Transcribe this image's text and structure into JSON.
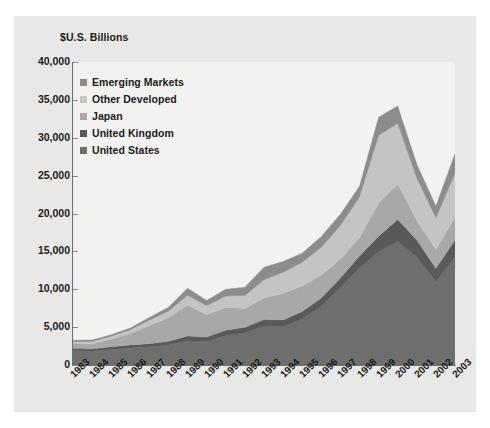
{
  "figure": {
    "axis_title": "$U.S. Billions",
    "panel_color": "#e8e8e6",
    "plot_color": "#f2f2f0"
  },
  "legend": {
    "position": "inside-top-left",
    "entries": [
      {
        "label": "Emerging Markets",
        "color": "#8c8c8c"
      },
      {
        "label": "Other Developed",
        "color": "#c4c4c4"
      },
      {
        "label": "Japan",
        "color": "#a8a8a8"
      },
      {
        "label": "United Kingdom",
        "color": "#595959"
      },
      {
        "label": "United States",
        "color": "#6e6e6e"
      }
    ]
  },
  "axes": {
    "y_ticks": [
      "0",
      "5,000",
      "10,000",
      "15,000",
      "20,000",
      "25,000",
      "30,000",
      "35,000",
      "40,000"
    ],
    "y_tick_values": [
      0,
      5000,
      10000,
      15000,
      20000,
      25000,
      30000,
      35000,
      40000
    ],
    "ylim": [
      0,
      40000
    ],
    "x_ticks": [
      "1983",
      "1984",
      "1985",
      "1986",
      "1987",
      "1988",
      "1989",
      "1990",
      "1991",
      "1992",
      "1993",
      "1994",
      "1995",
      "1996",
      "1997",
      "1998",
      "1999",
      "2000",
      "2001",
      "2002",
      "2003"
    ]
  },
  "chart_data": {
    "type": "area",
    "title": "",
    "subtitle": "",
    "xlabel": "",
    "ylabel": "$U.S. Billions",
    "ylim": [
      0,
      40000
    ],
    "grid": false,
    "legend_position": "inside-top-left",
    "stacked": true,
    "categories": [
      "1983",
      "1984",
      "1985",
      "1986",
      "1987",
      "1988",
      "1989",
      "1990",
      "1991",
      "1992",
      "1993",
      "1994",
      "1995",
      "1996",
      "1997",
      "1998",
      "1999",
      "2000",
      "2001",
      "2002",
      "2003"
    ],
    "series": [
      {
        "name": "United States",
        "color": "#6e6e6e",
        "values": [
          1900,
          1850,
          2050,
          2250,
          2400,
          2650,
          3200,
          3100,
          3900,
          4250,
          5150,
          5050,
          6100,
          7800,
          10200,
          12800,
          15000,
          16300,
          14300,
          11000,
          14300
        ]
      },
      {
        "name": "United Kingdom",
        "color": "#595959",
        "values": [
          300,
          280,
          350,
          400,
          420,
          480,
          620,
          580,
          700,
          720,
          860,
          900,
          950,
          1050,
          1300,
          1600,
          2000,
          2900,
          2200,
          1750,
          2200
        ]
      },
      {
        "name": "Japan",
        "color": "#a8a8a8",
        "values": [
          600,
          680,
          1000,
          1500,
          2400,
          3100,
          4100,
          2950,
          3000,
          2500,
          2850,
          3500,
          3400,
          3000,
          2500,
          2400,
          4400,
          4700,
          2600,
          2500,
          3000
        ]
      },
      {
        "name": "Other Developed",
        "color": "#c4c4c4",
        "values": [
          280,
          300,
          400,
          500,
          700,
          900,
          1300,
          1200,
          1500,
          1700,
          2400,
          2800,
          3100,
          3700,
          4400,
          5400,
          8900,
          8000,
          5600,
          4200,
          5800
        ]
      },
      {
        "name": "Emerging Markets",
        "color": "#8c8c8c",
        "values": [
          200,
          190,
          200,
          250,
          350,
          500,
          900,
          700,
          900,
          1100,
          1650,
          1400,
          1200,
          1400,
          1500,
          1400,
          2400,
          2300,
          1800,
          1500,
          2600
        ]
      }
    ]
  }
}
